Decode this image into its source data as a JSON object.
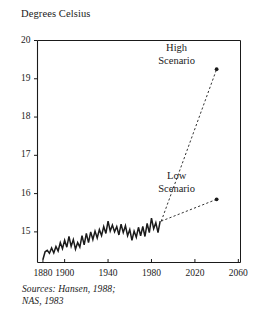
{
  "figure": {
    "axis_title": "Degrees\nCelsius",
    "source_note": "Sources: Hansen, 1988;\nNAS, 1983",
    "high_scenario_label": "High\nScenario",
    "low_scenario_label": "Low\nScenario",
    "ink_color": "#1a1a1a",
    "background_color": "#ffffff"
  },
  "chart_data": {
    "type": "line",
    "title": "",
    "subtitle": "",
    "xlabel": "",
    "ylabel": "Degrees Celsius",
    "xlim": [
      1875,
      2062
    ],
    "ylim": [
      14.2,
      20
    ],
    "grid": false,
    "legend_position": "none",
    "yticks": [
      20,
      19,
      18,
      17,
      16,
      15
    ],
    "ytick_labels": [
      "20",
      "19",
      "18",
      "17",
      "16",
      "15"
    ],
    "xticks": [
      1880,
      1900,
      1940,
      1980,
      2020,
      2060
    ],
    "xtick_labels": [
      "1880",
      "1900",
      "1940",
      "1980",
      "2020",
      "2060"
    ],
    "annotations": [
      {
        "text": "High Scenario",
        "x": 2040,
        "y": 19.25
      },
      {
        "text": "Low Scenario",
        "x": 2040,
        "y": 15.85
      },
      {
        "text": "Sources: Hansen, 1988; NAS, 1983",
        "x": null,
        "y": null
      }
    ],
    "series": [
      {
        "name": "Observed global mean temperature",
        "style": "solid",
        "x": [
          1880,
          1882,
          1884,
          1886,
          1888,
          1890,
          1892,
          1894,
          1896,
          1898,
          1900,
          1902,
          1904,
          1906,
          1908,
          1910,
          1912,
          1914,
          1916,
          1918,
          1920,
          1922,
          1924,
          1926,
          1928,
          1930,
          1932,
          1934,
          1936,
          1938,
          1940,
          1942,
          1944,
          1946,
          1948,
          1950,
          1952,
          1954,
          1956,
          1958,
          1960,
          1962,
          1964,
          1966,
          1968,
          1970,
          1972,
          1974,
          1976,
          1978,
          1980,
          1982,
          1984,
          1986,
          1988
        ],
        "values": [
          14.28,
          14.48,
          14.52,
          14.44,
          14.58,
          14.45,
          14.62,
          14.5,
          14.72,
          14.56,
          14.78,
          14.6,
          14.88,
          14.62,
          14.8,
          14.55,
          14.72,
          14.6,
          14.9,
          14.66,
          14.96,
          14.72,
          15.0,
          14.8,
          15.02,
          14.84,
          15.06,
          14.9,
          15.14,
          14.96,
          15.28,
          15.02,
          15.18,
          15.0,
          15.14,
          14.92,
          15.2,
          14.98,
          15.16,
          14.9,
          15.06,
          14.78,
          15.02,
          14.86,
          15.12,
          14.9,
          15.14,
          14.88,
          15.22,
          14.98,
          15.36,
          15.08,
          15.24,
          14.98,
          15.28
        ]
      },
      {
        "name": "High Scenario",
        "style": "dashed",
        "x": [
          1989,
          2040
        ],
        "values": [
          15.28,
          19.25
        ]
      },
      {
        "name": "Low Scenario",
        "style": "dashed",
        "x": [
          1989,
          2040
        ],
        "values": [
          15.28,
          15.85
        ]
      }
    ]
  }
}
